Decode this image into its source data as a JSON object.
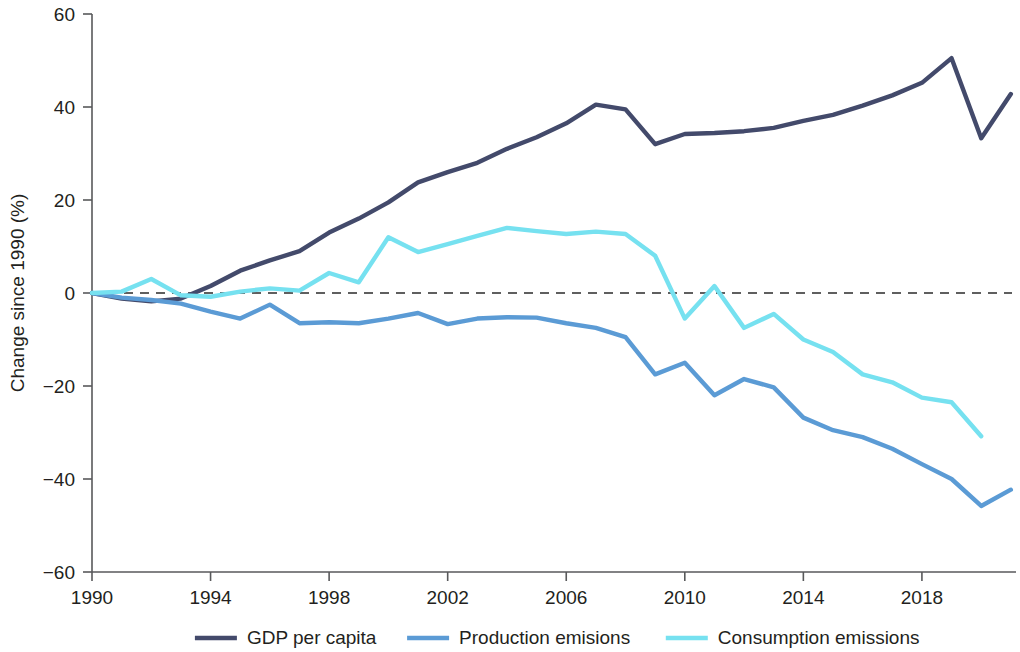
{
  "chart_data": {
    "type": "line",
    "title": "",
    "subtitle": "",
    "xlabel": "",
    "ylabel": "Change since 1990 (%)",
    "xlim": [
      1990,
      2021
    ],
    "ylim": [
      -60,
      60
    ],
    "yticks": [
      60,
      40,
      20,
      0,
      -20,
      -40,
      -60
    ],
    "ytick_labels": [
      "60",
      "40",
      "20",
      "0",
      "−20",
      "−40",
      "−60"
    ],
    "xticks": [
      1990,
      1994,
      1998,
      2002,
      2006,
      2010,
      2014,
      2018
    ],
    "xtick_labels": [
      "1990",
      "1994",
      "1998",
      "2002",
      "2006",
      "2010",
      "2014",
      "2018"
    ],
    "grid": false,
    "zero_reference_line": true,
    "legend_position": "bottom",
    "x": [
      1990,
      1991,
      1992,
      1993,
      1994,
      1995,
      1996,
      1997,
      1998,
      1999,
      2000,
      2001,
      2002,
      2003,
      2004,
      2005,
      2006,
      2007,
      2008,
      2009,
      2010,
      2011,
      2012,
      2013,
      2014,
      2015,
      2016,
      2017,
      2018,
      2019,
      2020,
      2021
    ],
    "series": [
      {
        "name": "GDP per capita",
        "color": "#434a6b",
        "values": [
          0,
          -1.2,
          -1.8,
          -1.2,
          1.5,
          4.8,
          7.0,
          9.0,
          13.0,
          16.0,
          19.5,
          23.8,
          26.0,
          28.0,
          31.0,
          33.5,
          36.5,
          40.5,
          39.5,
          32.0,
          34.2,
          34.4,
          34.8,
          35.5,
          37.0,
          38.3,
          40.3,
          42.5,
          45.2,
          50.5,
          33.3,
          42.8
        ]
      },
      {
        "name": "Production emisions",
        "color": "#5b9bd5",
        "values": [
          0,
          -1.0,
          -1.5,
          -2.3,
          -4.0,
          -5.5,
          -2.5,
          -6.5,
          -6.3,
          -6.5,
          -5.5,
          -4.3,
          -6.7,
          -5.5,
          -5.2,
          -5.3,
          -6.5,
          -7.5,
          -9.5,
          -17.5,
          -15.0,
          -22.0,
          -18.5,
          -20.3,
          -26.8,
          -29.5,
          -31.0,
          -33.5,
          -36.8,
          -40.0,
          -45.8,
          -42.3
        ]
      },
      {
        "name": "Consumption emissions",
        "color": "#76e1f0",
        "values": [
          0,
          0.3,
          3.0,
          -0.5,
          -0.8,
          0.3,
          1.0,
          0.5,
          4.3,
          2.3,
          12.0,
          8.8,
          10.5,
          12.3,
          14.0,
          13.3,
          12.7,
          13.2,
          12.7,
          8.0,
          -5.5,
          1.5,
          -7.5,
          -4.5,
          -10.0,
          -12.7,
          -17.5,
          -19.2,
          -22.5,
          -23.5,
          -30.8,
          null
        ]
      }
    ]
  },
  "legend": {
    "items": [
      {
        "label": "GDP per capita",
        "color": "#434a6b"
      },
      {
        "label": "Production emisions",
        "color": "#5b9bd5"
      },
      {
        "label": "Consumption emissions",
        "color": "#76e1f0"
      }
    ]
  },
  "axes": {
    "y_title": "Change since 1990 (%)"
  }
}
